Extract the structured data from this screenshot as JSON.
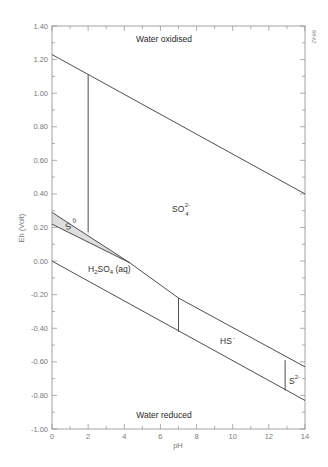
{
  "chart_data": {
    "type": "line",
    "title": "",
    "xlabel": "pH",
    "ylabel": "Eh (Volt)",
    "xlim": [
      0,
      14
    ],
    "ylim": [
      -1.0,
      1.4
    ],
    "x_ticks": [
      "0",
      "2",
      "4",
      "6",
      "8",
      "10",
      "12",
      "14"
    ],
    "y_ticks": [
      "1.40",
      "1.20",
      "1.00",
      "0.80",
      "0.60",
      "0.40",
      "0.20",
      "0.00",
      "-0.20",
      "-0.40",
      "-0.60",
      "-0.80",
      "-1.00"
    ],
    "grid": false,
    "figure_id": "6642",
    "series": [
      {
        "name": "Water oxidation boundary",
        "points": [
          [
            0,
            1.23
          ],
          [
            14,
            0.4
          ]
        ]
      },
      {
        "name": "Water reduction boundary",
        "points": [
          [
            0,
            0.0
          ],
          [
            14,
            -0.83
          ]
        ]
      },
      {
        "name": "SO4 2- / S0 upper boundary",
        "points": [
          [
            0,
            0.29
          ],
          [
            4.3,
            -0.01
          ]
        ]
      },
      {
        "name": "S0 / H2S lower boundary",
        "points": [
          [
            0,
            0.22
          ],
          [
            4.3,
            -0.01
          ]
        ]
      },
      {
        "name": "SO4 2- / reduced S boundary",
        "points": [
          [
            4.3,
            -0.01
          ],
          [
            7.0,
            -0.22
          ],
          [
            14,
            -0.63
          ]
        ]
      },
      {
        "name": "pH 2 vertical boundary",
        "points": [
          [
            2.0,
            1.11
          ],
          [
            2.0,
            0.17
          ]
        ]
      },
      {
        "name": "pH 7 vertical boundary (H2S/HS-)",
        "points": [
          [
            7.0,
            -0.22
          ],
          [
            7.0,
            -0.42
          ]
        ]
      },
      {
        "name": "pH 13 vertical boundary (HS-/S2-)",
        "points": [
          [
            12.9,
            -0.59
          ],
          [
            12.9,
            -0.77
          ]
        ]
      }
    ],
    "shaded_regions": [
      {
        "name": "S0 stability field",
        "points": [
          [
            0,
            0.29
          ],
          [
            4.3,
            -0.01
          ],
          [
            0,
            0.22
          ]
        ],
        "color": "#dedede"
      }
    ],
    "annotations": [
      {
        "text": "Water oxidised",
        "x": 6.2,
        "y": 1.29,
        "bold": true
      },
      {
        "text": "Water reduced",
        "x": 6.2,
        "y": -0.92,
        "bold": true
      },
      {
        "text": "SO4 2-",
        "base": "SO",
        "sub": "4",
        "sup": "2-",
        "x": 6.6,
        "y": 0.22
      },
      {
        "text": "S0",
        "base": "S",
        "sup": "0",
        "x": 0.6,
        "y": 0.21
      },
      {
        "text": "H2SO4 (aq)",
        "x": 2.0,
        "y": -0.07
      },
      {
        "text": "HS-",
        "base": "HS",
        "sup": "-",
        "x": 9.3,
        "y": -0.55
      },
      {
        "text": "S2-",
        "base": "S",
        "sup": "2-",
        "x": 13.05,
        "y": -0.7
      }
    ]
  },
  "labels": {
    "water_oxidised": "Water oxidised",
    "water_reduced": "Water reduced",
    "so4_base": "SO",
    "so4_sub": "4",
    "so4_sup": "2-",
    "s0_base": "S",
    "s0_sup": "0",
    "h2so4_h": "H",
    "h2so4_2": "2",
    "h2so4_so": "SO",
    "h2so4_4": "4",
    "h2so4_aq": " (aq)",
    "hs_base": "HS",
    "hs_sup": "-",
    "s2_base": "S",
    "s2_sup": "2-",
    "xlabel": "pH",
    "ylabel": "Eh (Volt)",
    "figure_id": "6642"
  }
}
